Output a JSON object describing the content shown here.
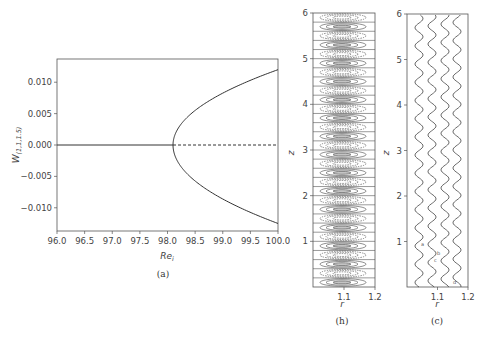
{
  "chart_data": [
    {
      "panel": "a",
      "type": "line",
      "caption": "(a)",
      "title": "",
      "xlabel": "Re_i",
      "ylabel": "W_(1,1,1.5)",
      "xlim": [
        96.0,
        100.0
      ],
      "ylim": [
        -0.0137,
        0.0137
      ],
      "xticks": [
        "96.0",
        "96.5",
        "97.0",
        "97.5",
        "98.0",
        "98.5",
        "99.0",
        "99.5",
        "100.0"
      ],
      "yticks": [
        "0.010",
        "0.005",
        "0.000",
        "-0.005",
        "-0.010"
      ],
      "grid": false,
      "bifurcation_point": 98.1,
      "series": [
        {
          "name": "stable trivial branch",
          "style": "solid",
          "x": [
            96.0,
            98.1
          ],
          "y": [
            0.0,
            0.0
          ]
        },
        {
          "name": "unstable trivial branch",
          "style": "dashed",
          "x": [
            98.1,
            100.0
          ],
          "y": [
            0.0,
            0.0
          ]
        },
        {
          "name": "upper pitchfork branch",
          "style": "solid",
          "x": [
            98.1,
            98.2,
            98.5,
            99.0,
            99.5,
            100.0
          ],
          "y": [
            0.0,
            0.0029,
            0.0058,
            0.0087,
            0.0105,
            0.012
          ]
        },
        {
          "name": "lower pitchfork branch",
          "style": "solid",
          "x": [
            98.1,
            98.2,
            98.5,
            99.0,
            99.5,
            100.0
          ],
          "y": [
            0.0,
            -0.0029,
            -0.0058,
            -0.009,
            -0.011,
            -0.0125
          ]
        }
      ]
    },
    {
      "panel": "b",
      "type": "contour",
      "caption": "(h)",
      "xlabel": "r",
      "ylabel": "z",
      "xlim": [
        1.0,
        1.2
      ],
      "ylim": [
        0,
        6
      ],
      "xticks": [
        "1.1",
        "1.2"
      ],
      "yticks": [
        "1",
        "2",
        "3",
        "4",
        "5",
        "6"
      ],
      "cells": 30,
      "description": "Stacked Taylor-vortex cells with alternating solid and dashed elliptical contours"
    },
    {
      "panel": "c",
      "type": "line",
      "caption": "(c)",
      "xlabel": "r",
      "ylabel": "z",
      "xlim": [
        1.0,
        1.2
      ],
      "ylim": [
        0,
        6
      ],
      "xticks": [
        "1.1",
        "1.2"
      ],
      "yticks": [
        "1",
        "2",
        "3",
        "4",
        "5",
        "6"
      ],
      "lines": 4,
      "wavelength_z": 0.4,
      "description": "Four wavy streamlines oscillating in r along z",
      "annotations": [
        "a",
        "b",
        "c",
        "d"
      ]
    }
  ],
  "panels": {
    "a": {
      "caption": "(a)",
      "xlabel": "Re",
      "xlabel_sub": "i",
      "ylabel": "W",
      "ylabel_sub": "(1,1,1.5)"
    },
    "b": {
      "caption": "(h)",
      "xlabel": "r",
      "ylabel": "z"
    },
    "c": {
      "caption": "(c)",
      "xlabel": "r",
      "ylabel": "z"
    }
  }
}
